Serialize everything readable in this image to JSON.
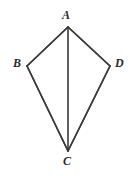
{
  "figure": {
    "name": "kite-abcd",
    "type": "geometry-diagram",
    "background_color": "#ffffff",
    "stroke_color": "#3a3a3a",
    "stroke_width": 1.6,
    "canvas": {
      "width": 132,
      "height": 176
    },
    "vertices": [
      {
        "id": "A",
        "label": "A",
        "x": 68,
        "y": 27,
        "label_x": 62,
        "label_y": 9
      },
      {
        "id": "B",
        "label": "B",
        "x": 27,
        "y": 66,
        "label_x": 13,
        "label_y": 57
      },
      {
        "id": "C",
        "label": "C",
        "x": 68,
        "y": 151,
        "label_x": 63,
        "label_y": 155
      },
      {
        "id": "D",
        "label": "D",
        "x": 110,
        "y": 66,
        "label_x": 115,
        "label_y": 57
      }
    ],
    "edges": [
      {
        "id": "AB",
        "from": "A",
        "to": "B"
      },
      {
        "id": "BC",
        "from": "B",
        "to": "C"
      },
      {
        "id": "CD",
        "from": "C",
        "to": "D"
      },
      {
        "id": "DA",
        "from": "D",
        "to": "A"
      }
    ],
    "diagonals": [
      {
        "id": "AC",
        "from": "A",
        "to": "C"
      }
    ],
    "labels": {
      "A": "A",
      "B": "B",
      "C": "C",
      "D": "D"
    }
  }
}
